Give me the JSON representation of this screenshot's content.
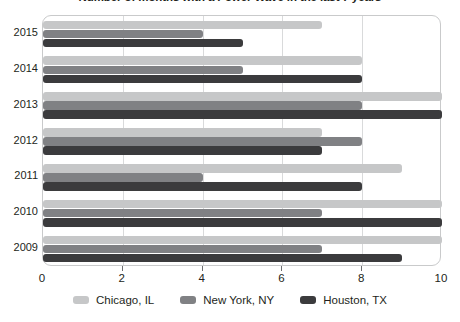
{
  "chart_data": {
    "type": "bar",
    "orientation": "horizontal",
    "title": "Number of months with a Power Wave in the last 7 years",
    "xlabel": "",
    "ylabel": "",
    "categories": [
      "2015",
      "2014",
      "2013",
      "2012",
      "2011",
      "2010",
      "2009"
    ],
    "series": [
      {
        "name": "Chicago, IL",
        "color": "#c6c7c8",
        "values": [
          7,
          8,
          10,
          7,
          9,
          10,
          10
        ]
      },
      {
        "name": "New York, NY",
        "color": "#808184",
        "values": [
          4,
          5,
          8,
          8,
          4,
          7,
          7
        ]
      },
      {
        "name": "Houston, TX",
        "color": "#3b3b3d",
        "values": [
          5,
          8,
          10,
          7,
          8,
          10,
          9
        ]
      }
    ],
    "xlim": [
      0,
      10
    ],
    "xticks": [
      0,
      2,
      4,
      6,
      8,
      10
    ],
    "xtick_labels": [
      "0",
      "2",
      "4",
      "6",
      "8",
      "10"
    ],
    "grid": true,
    "grid_axis": "x",
    "legend_position": "bottom"
  },
  "legend": {
    "items": [
      {
        "label": "Chicago, IL"
      },
      {
        "label": "New York, NY"
      },
      {
        "label": "Houston, TX"
      }
    ]
  }
}
